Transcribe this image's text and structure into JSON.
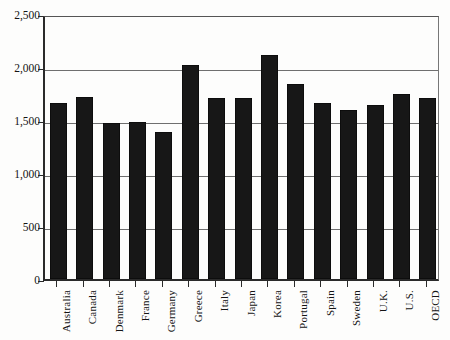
{
  "chart_data": {
    "type": "bar",
    "title": "",
    "subtitle": "",
    "xlabel": "",
    "ylabel": "",
    "categories": [
      "Australia",
      "Canada",
      "Denmark",
      "France",
      "Germany",
      "Greece",
      "Italy",
      "Japan",
      "Korea",
      "Portugal",
      "Spain",
      "Sweden",
      "U.K.",
      "U.S.",
      "OECD"
    ],
    "values": [
      1665,
      1720,
      1470,
      1480,
      1385,
      2020,
      1705,
      1705,
      2110,
      1840,
      1665,
      1595,
      1640,
      1745,
      1710
    ],
    "series": [
      {
        "name": "Annual hours worked",
        "values": [
          1665,
          1720,
          1470,
          1480,
          1385,
          2020,
          1705,
          1705,
          2110,
          1840,
          1665,
          1595,
          1640,
          1745,
          1710
        ]
      }
    ],
    "ylim": [
      0,
      2500
    ],
    "y_ticks": [
      0,
      500,
      1000,
      1500,
      2000,
      2500
    ],
    "y_tick_labels": [
      "0",
      "500",
      "1,000",
      "1,500",
      "2,000",
      "2,500"
    ],
    "grid": true,
    "gridlines_at": [
      500,
      1000,
      1500,
      2000,
      2500
    ],
    "legend": "none",
    "legend_position": "none",
    "bar_color": "#171717",
    "axis_color": "#2a2a2a",
    "grid_color": "#6f6f6f",
    "background_color": "#fdfdfc",
    "annotations": []
  }
}
